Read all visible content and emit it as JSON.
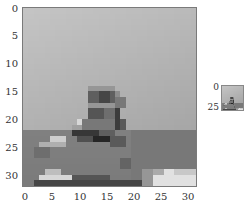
{
  "main_image": {
    "description": "32x32 grayscale pixelated image of a small boat/cabin on water",
    "x_ticks": [
      "0",
      "5",
      "10",
      "15",
      "20",
      "25",
      "30"
    ],
    "y_ticks": [
      "0",
      "5",
      "10",
      "15",
      "20",
      "25",
      "30"
    ],
    "x_range": [
      0,
      31
    ],
    "y_range": [
      0,
      31
    ],
    "pixel_rows": 32,
    "pixel_cols": 32
  },
  "thumbnail": {
    "y_ticks": [
      "0",
      "25"
    ]
  },
  "colors": {
    "sky": "#c0c0c0",
    "water": "#7e7e7e",
    "boat_dark": "#303030",
    "highlight": "#e0e0e0"
  }
}
